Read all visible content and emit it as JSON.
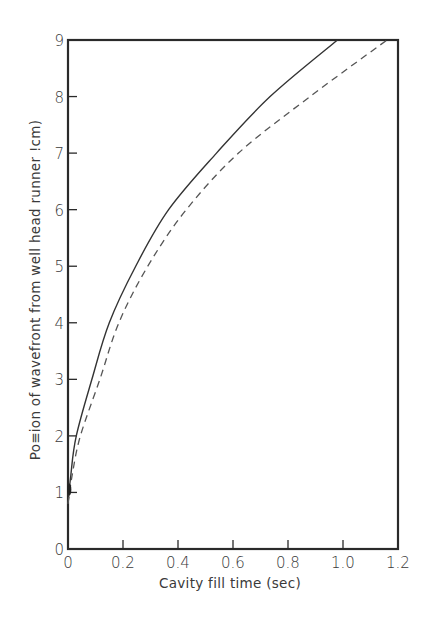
{
  "chart_data": {
    "type": "line",
    "title": "",
    "xlabel": "Cavity fill time (sec)",
    "ylabel": "Po≡ion of wavefront from well head runner !cm)",
    "ylabel_intended": "Position of wavefront from well head runner (cm)",
    "xlim": [
      0,
      1.2
    ],
    "ylim": [
      0,
      9
    ],
    "x_ticks": [
      "0",
      "0.2",
      "0.4",
      "0.6",
      "0.8",
      "1.0",
      "1.2"
    ],
    "x_tick_values": [
      0,
      0.2,
      0.4,
      0.6,
      0.8,
      1.0,
      1.2
    ],
    "y_ticks": [
      "0",
      "1",
      "2",
      "3",
      "4",
      "5",
      "6",
      "7",
      "8",
      "9"
    ],
    "y_tick_values": [
      0,
      1,
      2,
      3,
      4,
      5,
      6,
      7,
      8,
      9
    ],
    "grid": false,
    "legend": null,
    "series": [
      {
        "name": "solid curve",
        "style": "solid",
        "color": "#333333",
        "x": [
          0,
          0.01,
          0.03,
          0.087,
          0.15,
          0.246,
          0.366,
          0.54,
          0.735,
          0.98
        ],
        "y": [
          0.8,
          1.3,
          2,
          3,
          4,
          5,
          6,
          7,
          8,
          9
        ]
      },
      {
        "name": "dashed curve",
        "style": "dashed",
        "color": "#555555",
        "x": [
          0,
          0.015,
          0.045,
          0.116,
          0.185,
          0.29,
          0.43,
          0.62,
          0.88,
          1.16
        ],
        "y": [
          0.8,
          1.3,
          2,
          3,
          4,
          5,
          6,
          7,
          8,
          9
        ]
      }
    ]
  },
  "layout": {
    "plot": {
      "left": 68,
      "top": 40,
      "right": 398,
      "bottom": 549
    },
    "x_label_pos": {
      "x": 230,
      "y": 588
    },
    "y_label_pos": {
      "x": 40,
      "y": 290
    }
  }
}
